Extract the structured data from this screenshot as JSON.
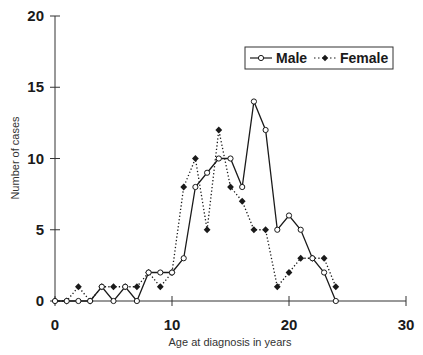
{
  "chart_data": {
    "type": "line",
    "title": "",
    "xlabel": "Age at diagnosis in years",
    "ylabel": "Number of cases",
    "xlim": [
      0,
      30
    ],
    "ylim": [
      0,
      20
    ],
    "x_ticks": [
      0,
      10,
      20,
      30
    ],
    "y_ticks": [
      0,
      5,
      10,
      15,
      20
    ],
    "grid": false,
    "legend_position": "top-right",
    "x": [
      0,
      1,
      2,
      3,
      4,
      5,
      6,
      7,
      8,
      9,
      10,
      11,
      12,
      13,
      14,
      15,
      16,
      17,
      18,
      19,
      20,
      21,
      22,
      23,
      24
    ],
    "series": [
      {
        "name": "Male",
        "line_style": "solid",
        "marker": "open-circle",
        "values": [
          0,
          0,
          0,
          0,
          1,
          0,
          1,
          0,
          2,
          2,
          2,
          3,
          8,
          9,
          10,
          10,
          8,
          14,
          12,
          5,
          6,
          5,
          3,
          2,
          0
        ]
      },
      {
        "name": "Female",
        "line_style": "dotted",
        "marker": "filled-diamond",
        "values": [
          0,
          0,
          1,
          0,
          1,
          1,
          1,
          1,
          2,
          1,
          2,
          8,
          10,
          5,
          12,
          8,
          7,
          5,
          5,
          1,
          2,
          3,
          3,
          3,
          1
        ]
      }
    ]
  },
  "colors": {
    "line": "#1a1a1a",
    "axis": "#333333",
    "background": "#ffffff"
  }
}
